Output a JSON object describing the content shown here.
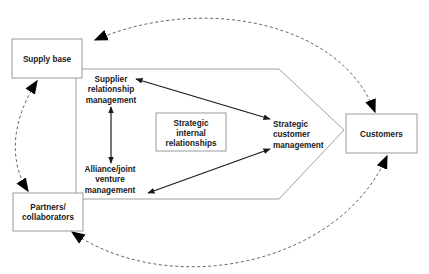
{
  "diagram": {
    "nodes": {
      "supply_base": "Supply base",
      "partners": [
        "Partners/",
        "collaborators"
      ],
      "customers": "Customers",
      "supplier_rel": [
        "Supplier",
        "relationship",
        "management"
      ],
      "alliance": [
        "Alliance/joint",
        "venture",
        "management"
      ],
      "strategic_internal": [
        "Strategic",
        "internal",
        "relationships"
      ],
      "strategic_customer": [
        "Strategic",
        "customer",
        "management"
      ]
    },
    "edges": [
      {
        "from": "Supplier relationship management",
        "to": "Strategic customer management",
        "style": "solid",
        "direction": "both"
      },
      {
        "from": "Supplier relationship management",
        "to": "Alliance/joint venture management",
        "style": "solid",
        "direction": "both"
      },
      {
        "from": "Alliance/joint venture management",
        "to": "Strategic customer management",
        "style": "solid",
        "direction": "both"
      },
      {
        "from": "Customers",
        "to": "Supply base",
        "style": "dashed",
        "direction": "both"
      },
      {
        "from": "Supply base",
        "to": "Partners/collaborators",
        "style": "dashed",
        "direction": "both"
      },
      {
        "from": "Partners/collaborators",
        "to": "Customers",
        "style": "dashed",
        "direction": "both"
      }
    ],
    "colors": {
      "line": "#1a1a1a",
      "dashed": "#666666",
      "box_border": "#9a9a9a",
      "background": "#ffffff"
    }
  }
}
